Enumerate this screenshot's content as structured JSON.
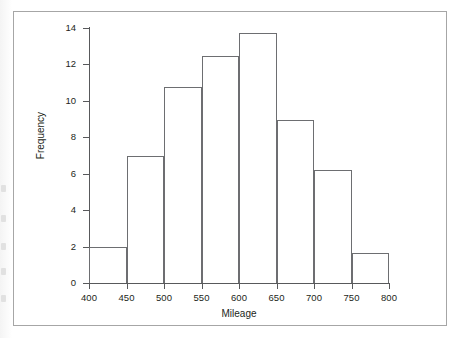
{
  "figure": {
    "background_color": "#ffffff",
    "frame_color": "#a6a6a6",
    "axis_color": "#58595b",
    "bar_outline_color": "#6d6e71",
    "bar_fill_color": "#ffffff"
  },
  "scan_artifacts": [
    {
      "top": 185
    },
    {
      "top": 215
    },
    {
      "top": 243
    },
    {
      "top": 268
    },
    {
      "top": 295
    }
  ],
  "chart_data": {
    "type": "bar",
    "title": "",
    "subtitle": "",
    "xlabel": "Mileage",
    "ylabel": "Frequency",
    "xlim": [
      400,
      800
    ],
    "ylim": [
      0,
      14
    ],
    "grid": false,
    "legend": null,
    "x_ticks": [
      400,
      450,
      500,
      550,
      600,
      650,
      700,
      750,
      800
    ],
    "x_tick_labels": [
      "400",
      "450",
      "500",
      "550",
      "600",
      "650",
      "700",
      "750",
      "800"
    ],
    "y_ticks": [
      0,
      2,
      4,
      6,
      8,
      10,
      12,
      14
    ],
    "y_tick_labels": [
      "0",
      "2",
      "4",
      "6",
      "8",
      "10",
      "12",
      "14"
    ],
    "bin_width": 50,
    "bin_edges": [
      400,
      450,
      500,
      550,
      600,
      650,
      700,
      750,
      800
    ],
    "categories": [
      "400-450",
      "450-500",
      "500-550",
      "550-600",
      "600-650",
      "650-700",
      "700-750",
      "750-800"
    ],
    "values": [
      2.0,
      7.0,
      10.75,
      12.45,
      13.75,
      8.95,
      6.2,
      1.65
    ]
  }
}
